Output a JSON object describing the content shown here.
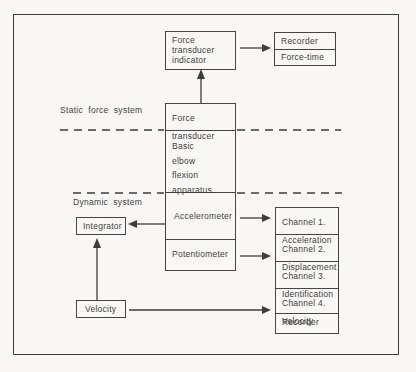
{
  "colors": {
    "ink": "#3d3d3d",
    "paper": "#f8f7f4"
  },
  "section_labels": {
    "static": "Static force system",
    "dynamic": "Dynamic system"
  },
  "static_section": {
    "force_transducer_indicator": "Force\ntransducer\nindicator",
    "recorder": "Recorder",
    "force_time": "Force-time",
    "force_transducer": "Force\ntransducer"
  },
  "apparatus": "Basic\nelbow\nflexion\napparatus",
  "dynamic_section": {
    "accelerometer": "Accelerometer",
    "potentiometer": "Potentiometer",
    "integrator": "Integrator",
    "velocity": "Velocity"
  },
  "channels": [
    "Channel 1.\nAcceleration",
    "Channel 2.\nDisplacement",
    "Channel 3.\nIdentification",
    "Channel 4.\nVelocity",
    "Recorder"
  ]
}
